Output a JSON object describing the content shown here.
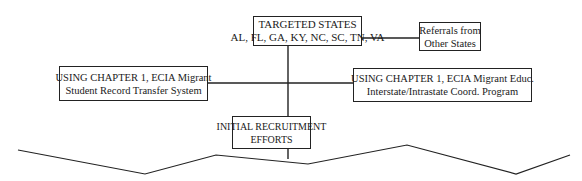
{
  "diagram": {
    "nodes": [
      {
        "id": "targeted_states",
        "lines": [
          "TARGETED STATES",
          "AL, FL, GA, KY, NC, SC, TN, VA"
        ]
      },
      {
        "id": "referrals",
        "lines": [
          "Referrals from",
          "Other States"
        ]
      },
      {
        "id": "msrts",
        "lines": [
          "USING CHAPTER 1, ECIA Migrant",
          "Student Record Transfer System"
        ]
      },
      {
        "id": "coord_program",
        "lines": [
          "USING CHAPTER 1, ECIA Migrant Educ.",
          "Interstate/Intrastate Coord. Program"
        ]
      },
      {
        "id": "initial_recruitment",
        "lines": [
          "INITIAL RECRUITMENT",
          "EFFORTS"
        ]
      }
    ],
    "edges": [
      {
        "from": "targeted_states",
        "to": "referrals"
      },
      {
        "from": "targeted_states",
        "to": "initial_recruitment"
      },
      {
        "from": "msrts",
        "to": "coord_program"
      }
    ],
    "footer": "zigzag break line (diagram continues)"
  }
}
